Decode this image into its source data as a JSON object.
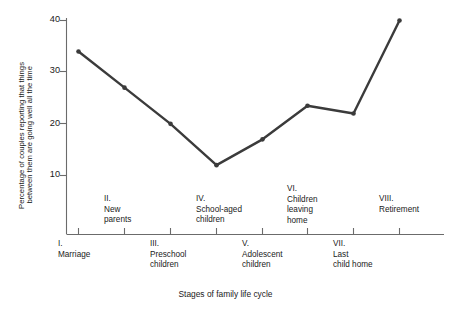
{
  "chart_data": {
    "type": "line",
    "title": "",
    "xlabel": "Stages of family life cycle",
    "ylabel_line1": "Percentage of couples reporting that things",
    "ylabel_line2": "between them are going well all the time",
    "categories": [
      "I. Marriage",
      "II. New parents",
      "III. Preschool children",
      "IV. School-aged children",
      "V. Adolescent children",
      "VI. Children leaving home",
      "VII. Last child home",
      "VIII. Retirement"
    ],
    "values": [
      34,
      27,
      20,
      12,
      17,
      23.5,
      22,
      40
    ],
    "ylim": [
      5,
      40
    ],
    "yticks": [
      10,
      20,
      30,
      40
    ],
    "ytick_labels": [
      "10",
      "20",
      "30",
      "40"
    ],
    "grid": false,
    "legend": null,
    "line_color": "#3b3b3b",
    "marker": "circle",
    "axis_color": "#6b6b6b"
  },
  "axis": {
    "ytick_labels": [
      "40",
      "30",
      "20",
      "10"
    ],
    "xaxis_title": "Stages of family life cycle",
    "ylabel_line1": "Percentage of couples reporting that things",
    "ylabel_line2": "between them are going well all the time"
  },
  "stages": {
    "upper": [
      {
        "numeral": "II.",
        "text": "II.\nNew\nparents"
      },
      {
        "numeral": "IV.",
        "text": "IV.\nSchool-aged\nchildren"
      },
      {
        "numeral": "VI.",
        "text": "VI.\nChildren\nleaving\nhome"
      },
      {
        "numeral": "VIII.",
        "text": "VIII.\nRetirement"
      }
    ],
    "lower": [
      {
        "numeral": "I.",
        "text": "I.\nMarriage"
      },
      {
        "numeral": "III.",
        "text": "III.\nPreschool\nchildren"
      },
      {
        "numeral": "V.",
        "text": "V.\nAdolescent\nchildren"
      },
      {
        "numeral": "VII.",
        "text": "VII.\nLast\nchild home"
      }
    ]
  }
}
